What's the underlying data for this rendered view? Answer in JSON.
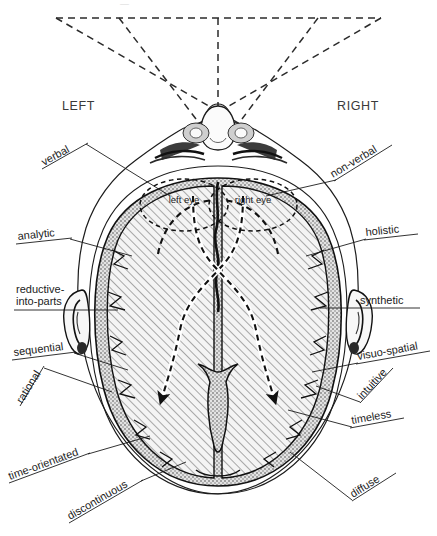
{
  "figure": {
    "view_labels": {
      "left": "LEFT",
      "right": "RIGHT"
    },
    "eye_labels": {
      "left_eye": "left eye",
      "right_eye": "right eye"
    }
  },
  "left_hemisphere_annotations": [
    {
      "id": "verbal",
      "label": "verbal"
    },
    {
      "id": "analytic",
      "label": "analytic"
    },
    {
      "id": "reductive-into-parts",
      "label_line1": "reductive-",
      "label_line2": "into-parts"
    },
    {
      "id": "sequential",
      "label": "sequential"
    },
    {
      "id": "rational",
      "label": "rational"
    },
    {
      "id": "time-orientated",
      "label": "time-orientated"
    },
    {
      "id": "discontinuous",
      "label": "discontinuous"
    }
  ],
  "right_hemisphere_annotations": [
    {
      "id": "non-verbal",
      "label": "non-verbal"
    },
    {
      "id": "holistic",
      "label": "holistic"
    },
    {
      "id": "synthetic",
      "label": "synthetic"
    },
    {
      "id": "visuo-spatial",
      "label": "visuo-spatial"
    },
    {
      "id": "intuitive",
      "label": "intuitive"
    },
    {
      "id": "timeless",
      "label": "timeless"
    },
    {
      "id": "diffuse",
      "label": "diffuse"
    }
  ],
  "colors": {
    "ink": "#1c1c1c",
    "hatch": "#8d8d8d",
    "paper": "#ffffff",
    "brain_fill": "#f2f2f2"
  }
}
